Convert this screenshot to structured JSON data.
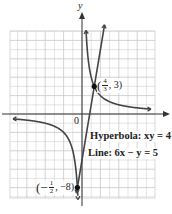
{
  "chart_data": {
    "type": "line",
    "title": "",
    "xlabel": "",
    "ylabel": "y",
    "origin_label": "0",
    "grid": true,
    "xlim": [
      -8,
      8
    ],
    "ylim": [
      -9,
      9
    ],
    "series": [
      {
        "name": "Hyperbola: xy = 4",
        "equation": "xy = 4",
        "kind": "hyperbola",
        "color": "#444444"
      },
      {
        "name": "Line: 6x − y = 5",
        "equation": "6x - y = 5",
        "kind": "line",
        "color": "#444444"
      }
    ],
    "points": [
      {
        "x": 1.3333,
        "y": 3,
        "label_num": "4",
        "label_den": "3",
        "label_y": "3"
      },
      {
        "x": -0.5,
        "y": -8,
        "label_num": "1",
        "label_den": "2",
        "label_y": "−8"
      }
    ],
    "annotations": [
      {
        "text": "Hyperbola: xy = 4"
      },
      {
        "text": "Line: 6x − y = 5"
      }
    ],
    "colors": {
      "grid": "#c8c8c8",
      "axis": "#333333",
      "curve": "#444444",
      "point": "#111111"
    }
  },
  "labels": {
    "y_axis": "y",
    "origin": "0",
    "hyperbola": "Hyperbola: xy = 4",
    "line": "Line: 6x − y = 5",
    "p1_open": "(",
    "p1_num": "4",
    "p1_den": "3",
    "p1_rest": ", 3)",
    "p2_open": "(−",
    "p2_num": "1",
    "p2_den": "2",
    "p2_rest": ", −8)"
  }
}
